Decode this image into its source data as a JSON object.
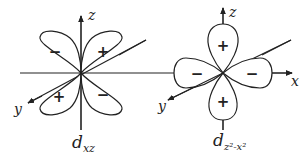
{
  "diagrams": [
    {
      "name": "d_xz",
      "caption_main": "d",
      "caption_sub": "xz",
      "axes": {
        "z": "z",
        "y": "y"
      },
      "lobes": [
        {
          "position": "upper-left",
          "sign": "−"
        },
        {
          "position": "upper-right",
          "sign": "+"
        },
        {
          "position": "lower-left",
          "sign": "+"
        },
        {
          "position": "lower-right",
          "sign": "−"
        }
      ]
    },
    {
      "name": "d_z2-x2",
      "caption_main": "d",
      "caption_sub": "z²-x²",
      "axes": {
        "z": "z",
        "x": "x",
        "y": "y"
      },
      "lobes": [
        {
          "position": "top",
          "sign": "+"
        },
        {
          "position": "bottom",
          "sign": "+"
        },
        {
          "position": "left",
          "sign": "−"
        },
        {
          "position": "right",
          "sign": "−"
        }
      ]
    }
  ],
  "colors": {
    "stroke": "#222222",
    "background": "#ffffff"
  }
}
